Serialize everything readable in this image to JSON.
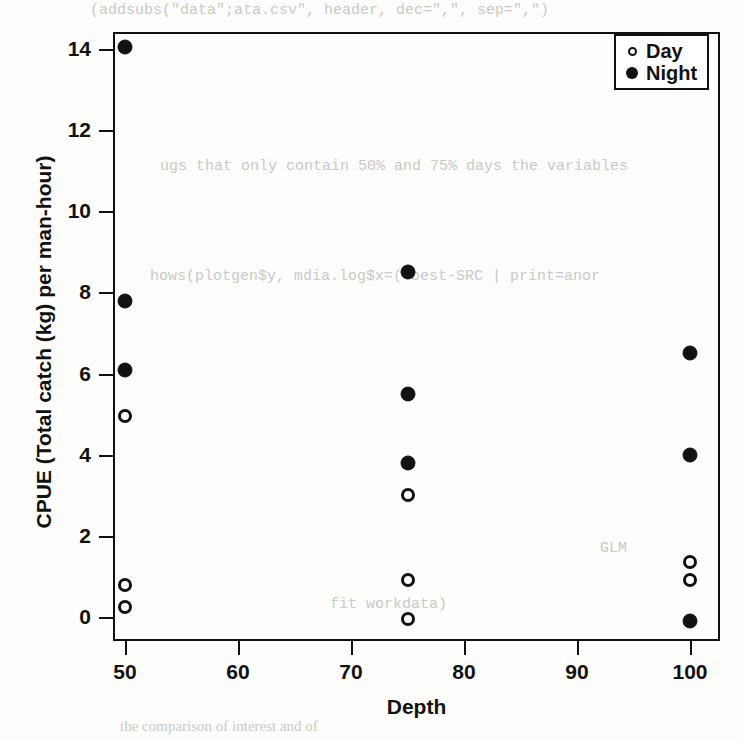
{
  "chart_data": {
    "type": "scatter",
    "title": "",
    "xlabel": "Depth",
    "ylabel": "CPUE (Total catch (kg) per man-hour)",
    "xlim": [
      46,
      104
    ],
    "ylim": [
      -0.9,
      14.9
    ],
    "xticks": [
      50,
      60,
      70,
      80,
      90,
      100
    ],
    "yticks": [
      0,
      2,
      4,
      6,
      8,
      10,
      12,
      14
    ],
    "grid": false,
    "legend_position": "top-right",
    "series": [
      {
        "name": "Day",
        "marker": "open-circle",
        "color": "#111111",
        "points": [
          {
            "x": 50,
            "y": 4.95
          },
          {
            "x": 50,
            "y": 0.8
          },
          {
            "x": 50,
            "y": 0.25
          },
          {
            "x": 75,
            "y": 3.0
          },
          {
            "x": 75,
            "y": 0.9
          },
          {
            "x": 75,
            "y": -0.05
          },
          {
            "x": 100,
            "y": 1.35
          },
          {
            "x": 100,
            "y": 0.9
          }
        ]
      },
      {
        "name": "Night",
        "marker": "filled-circle",
        "color": "#111111",
        "points": [
          {
            "x": 50,
            "y": 14.05
          },
          {
            "x": 50,
            "y": 7.8
          },
          {
            "x": 50,
            "y": 6.1
          },
          {
            "x": 75,
            "y": 8.5
          },
          {
            "x": 75,
            "y": 5.5
          },
          {
            "x": 75,
            "y": 3.8
          },
          {
            "x": 100,
            "y": 6.5
          },
          {
            "x": 100,
            "y": 4.0
          },
          {
            "x": 100,
            "y": -0.1
          }
        ]
      }
    ]
  },
  "legend": {
    "items": [
      {
        "label": "Day",
        "marker": "open-circle"
      },
      {
        "label": "Night",
        "marker": "filled-circle"
      }
    ]
  },
  "background_text": {
    "line_top": "(addsubs(\"data\";ata.csv\", header, dec=\",\", sep=\",\")",
    "line_a": "ugs that only contain 50% and 75% days the variables",
    "line_b": "hows(plotgen$y, mdia.log$x=(\"best-SRC | print=anor",
    "line_c": "GLM",
    "line_d": "fit workdata)",
    "line_e": "the comparison of interest and of"
  }
}
